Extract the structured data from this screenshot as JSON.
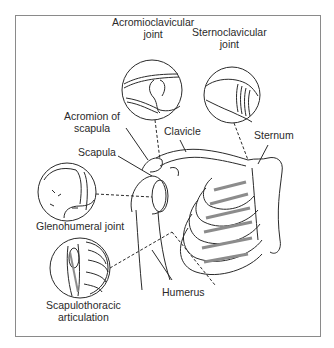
{
  "figure": {
    "labels": {
      "ac_joint_line1": "Acromioclavicular",
      "ac_joint_line2": "joint",
      "sc_joint_line1": "Sternoclavicular",
      "sc_joint_line2": "joint",
      "acromion_line1": "Acromion of",
      "acromion_line2": "scapula",
      "clavicle": "Clavicle",
      "sternum": "Sternum",
      "scapula": "Scapula",
      "glenohumeral": "Glenohumeral joint",
      "humerus": "Humerus",
      "st_line1": "Scapulothoracic",
      "st_line2": "articulation"
    },
    "colors": {
      "line": "#2a2a2a",
      "frame": "#8a8a8a",
      "cartilage_fill": "#8c8c8c"
    }
  }
}
